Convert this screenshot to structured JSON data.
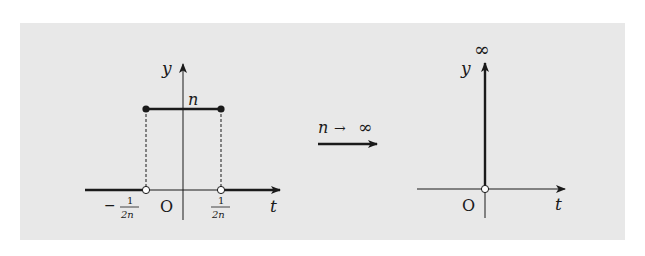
{
  "panel": {
    "background": "#e8e8e8",
    "border": "#dcdcdc"
  },
  "colors": {
    "ink": "#1a1a1a",
    "hollow_fill": "#ffffff"
  },
  "left_plot": {
    "y_axis_label": "y",
    "x_axis_label": "t",
    "origin_label": "O",
    "height_label": "n",
    "left_tick": {
      "sign": "−",
      "numerator": "1",
      "denominator": "2n"
    },
    "right_tick": {
      "numerator": "1",
      "denominator": "2n"
    }
  },
  "transition": {
    "label_var": "n",
    "label_arrow": "→",
    "label_limit": "∞"
  },
  "right_plot": {
    "y_axis_label": "y",
    "x_axis_label": "t",
    "origin_label": "O",
    "impulse_label": "∞"
  }
}
